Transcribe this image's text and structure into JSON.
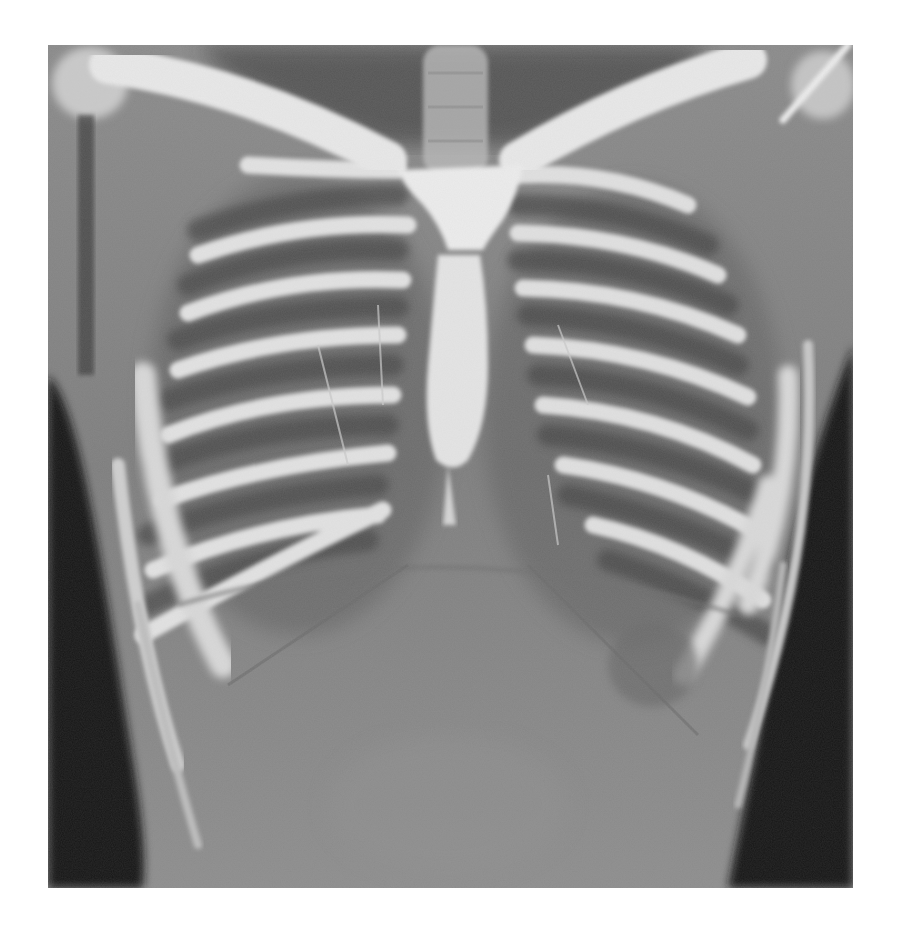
{
  "page": {
    "background": "#ffffff",
    "caption_cropped": ""
  },
  "figure": {
    "type": "coronal chest CT maximum-intensity projection (grayscale)",
    "alt": "Coronal view of the thorax showing clavicles, sternum (manubrium and body), bilateral rib cage and upper abdomen",
    "structures": [
      "left-clavicle",
      "right-clavicle",
      "manubrium",
      "sternal-body",
      "left-ribs",
      "right-ribs",
      "left-humeral-head",
      "right-humeral-head",
      "trachea",
      "diaphragm",
      "upper-abdomen"
    ],
    "colors": {
      "bone": "#e6e6e6",
      "soft_tissue": "#8c8c8c",
      "intercostal": "#4a4a4a",
      "air_background": "#141414"
    }
  }
}
